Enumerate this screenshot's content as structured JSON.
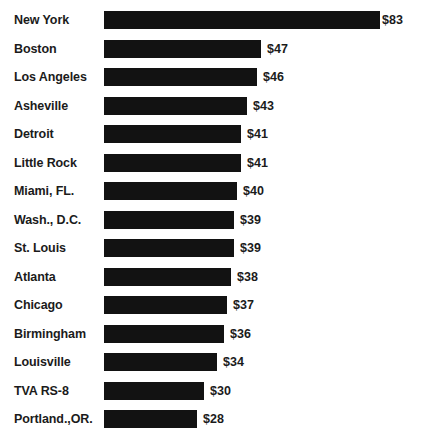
{
  "chart_data": {
    "type": "bar",
    "orientation": "horizontal",
    "title": "",
    "subtitle": "",
    "xlabel": "",
    "ylabel": "",
    "grid": false,
    "legend": false,
    "value_prefix": "$",
    "xlim": [
      0,
      83
    ],
    "categories": [
      "New York",
      "Boston",
      "Los Angeles",
      "Asheville",
      "Detroit",
      "Little Rock",
      "Miami, FL.",
      "Wash., D.C.",
      "St. Louis",
      "Atlanta",
      "Chicago",
      "Birmingham",
      "Louisville",
      "TVA RS-8",
      "Portland.,OR."
    ],
    "values": [
      83,
      47,
      46,
      43,
      41,
      41,
      40,
      39,
      39,
      38,
      37,
      36,
      34,
      30,
      28
    ],
    "value_labels": [
      "$83",
      "$47",
      "$46",
      "$43",
      "$41",
      "$41",
      "$40",
      "$39",
      "$39",
      "$38",
      "$37",
      "$36",
      "$34",
      "$30",
      "$28"
    ]
  },
  "rows": [
    {
      "label": "New York",
      "value": 83,
      "value_label": "$83"
    },
    {
      "label": "Boston",
      "value": 47,
      "value_label": "$47"
    },
    {
      "label": "Los Angeles",
      "value": 46,
      "value_label": "$46"
    },
    {
      "label": "Asheville",
      "value": 43,
      "value_label": "$43"
    },
    {
      "label": "Detroit",
      "value": 41,
      "value_label": "$41"
    },
    {
      "label": "Little Rock",
      "value": 41,
      "value_label": "$41"
    },
    {
      "label": "Miami, FL.",
      "value": 40,
      "value_label": "$40"
    },
    {
      "label": "Wash., D.C.",
      "value": 39,
      "value_label": "$39"
    },
    {
      "label": "St. Louis",
      "value": 39,
      "value_label": "$39"
    },
    {
      "label": "Atlanta",
      "value": 38,
      "value_label": "$38"
    },
    {
      "label": "Chicago",
      "value": 37,
      "value_label": "$37"
    },
    {
      "label": "Birmingham",
      "value": 36,
      "value_label": "$36"
    },
    {
      "label": "Louisville",
      "value": 34,
      "value_label": "$34"
    },
    {
      "label": "TVA RS-8",
      "value": 30,
      "value_label": "$30"
    },
    {
      "label": "Portland.,OR.",
      "value": 28,
      "value_label": "$28"
    }
  ],
  "style": {
    "bar_color": "#121212",
    "text_color": "#1b1b1b",
    "background": "#ffffff"
  },
  "geometry": {
    "bar_origin_x": 104,
    "px_per_unit": 3.33,
    "row_pitch": 28.5,
    "first_row_center_y": 20,
    "bar_height": 18
  }
}
